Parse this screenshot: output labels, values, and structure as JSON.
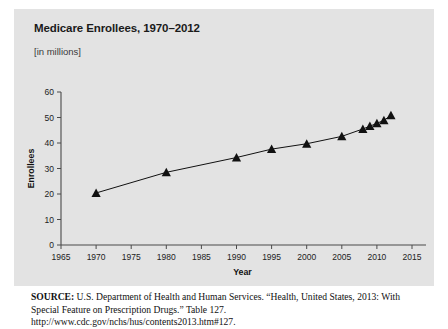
{
  "figure": {
    "title": "Medicare Enrollees, 1970–2012",
    "subtitle": "[in millions]",
    "source_label": "SOURCE:",
    "source_text": " U.S. Department of Health and Human Services. “Health, United States, 2013: With Special Feature on Prescription Drugs.” Table 127. http://www.cdc.gov/nchs/hus/contents2013.htm#127.",
    "panel_color": "#e3e3e3",
    "line_color": "#111111",
    "marker_color": "#111111"
  },
  "chart_data": {
    "type": "line",
    "title": "Medicare Enrollees, 1970–2012",
    "subtitle": "[in millions]",
    "xlabel": "Year",
    "ylabel": "Enrollees",
    "xlim": [
      1965,
      2015
    ],
    "ylim": [
      0,
      60
    ],
    "xticks": [
      1965,
      1970,
      1975,
      1980,
      1985,
      1990,
      1995,
      2000,
      2005,
      2010,
      2015
    ],
    "yticks": [
      0,
      10,
      20,
      30,
      40,
      50,
      60
    ],
    "xtick_labels": [
      "1965",
      "1970",
      "1975",
      "1980",
      "1985",
      "1990",
      "1995",
      "2000",
      "2005",
      "2010",
      "2015"
    ],
    "ytick_labels": [
      "0",
      "10",
      "20",
      "30",
      "40",
      "50",
      "60"
    ],
    "grid": false,
    "legend": false,
    "marker": "triangle",
    "x": [
      1970,
      1980,
      1990,
      1995,
      2000,
      2005,
      2008,
      2009,
      2010,
      2011,
      2012
    ],
    "values": [
      20.4,
      28.5,
      34.3,
      37.6,
      39.7,
      42.6,
      45.5,
      46.6,
      47.7,
      48.9,
      50.8
    ],
    "series": [
      {
        "name": "Medicare Enrollees",
        "x": [
          1970,
          1980,
          1990,
          1995,
          2000,
          2005,
          2008,
          2009,
          2010,
          2011,
          2012
        ],
        "values": [
          20.4,
          28.5,
          34.3,
          37.6,
          39.7,
          42.6,
          45.5,
          46.6,
          47.7,
          48.9,
          50.8
        ]
      }
    ]
  }
}
